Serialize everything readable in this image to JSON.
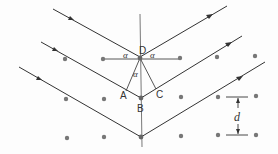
{
  "diagram": {
    "labels": {
      "D": "D",
      "A": "A",
      "B": "B",
      "C": "C",
      "alpha_left": "α",
      "alpha_right": "α",
      "alpha_lower": "α",
      "spacing": "d"
    },
    "colors": {
      "line": "#333333",
      "atom": "#777777",
      "background": "#fdfdfd"
    },
    "atom_rows": [
      {
        "y": 59,
        "x": [
          65,
          103,
          180,
          217,
          255
        ]
      },
      {
        "y": 98,
        "x": [
          66,
          104,
          141,
          181,
          218,
          256
        ]
      },
      {
        "y": 137,
        "x": [
          67,
          104,
          141,
          181,
          218,
          256
        ]
      }
    ]
  }
}
